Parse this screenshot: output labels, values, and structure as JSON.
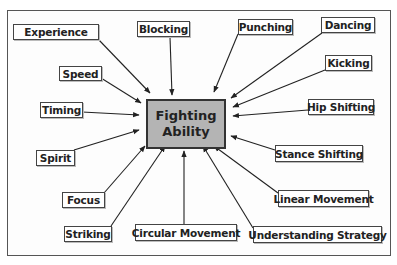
{
  "diagram": {
    "type": "hub-and-spoke concept map",
    "center": {
      "line1": "Fighting",
      "line2": "Ability",
      "fill_color": "#b4b4b4"
    },
    "factors": [
      {
        "id": "experience",
        "label": "Experience"
      },
      {
        "id": "blocking",
        "label": "Blocking"
      },
      {
        "id": "punching",
        "label": "Punching"
      },
      {
        "id": "dancing",
        "label": "Dancing"
      },
      {
        "id": "kicking",
        "label": "Kicking"
      },
      {
        "id": "hip-shifting",
        "label": "Hip Shifting"
      },
      {
        "id": "speed",
        "label": "Speed"
      },
      {
        "id": "timing",
        "label": "Timing"
      },
      {
        "id": "spirit",
        "label": "Spirit"
      },
      {
        "id": "focus",
        "label": "Focus"
      },
      {
        "id": "striking",
        "label": "Striking"
      },
      {
        "id": "circular-movement",
        "label": "Circular Movement"
      },
      {
        "id": "understanding-strategy",
        "label": "Understanding Strategy"
      },
      {
        "id": "stance-shifting",
        "label": "Stance Shifting"
      },
      {
        "id": "linear-movement",
        "label": "Linear Movement"
      }
    ],
    "arrow_direction": "from each factor toward center"
  }
}
